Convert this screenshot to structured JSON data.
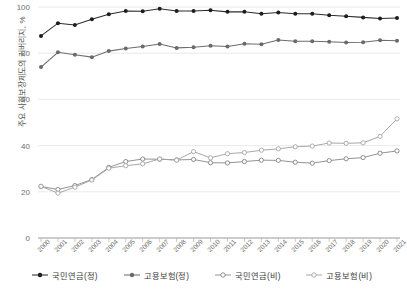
{
  "chart_data": {
    "type": "line",
    "title": "",
    "subtitle": "",
    "xlabel": "",
    "ylabel": "주요 사회보장제도의 커버리지, %",
    "xlim": [
      2000,
      2021
    ],
    "ylim": [
      0,
      100
    ],
    "yticks": [
      0,
      20,
      40,
      60,
      80,
      100
    ],
    "grid": true,
    "legend_position": "bottom",
    "categories": [
      "2000",
      "2001",
      "2002",
      "2003",
      "2004",
      "2005",
      "2006",
      "2007",
      "2008",
      "2009",
      "2010",
      "2011",
      "2012",
      "2013",
      "2014",
      "2015",
      "2016",
      "2017",
      "2018",
      "2019",
      "2020",
      "2021"
    ],
    "series": [
      {
        "name": "국민연금(정)",
        "marker": "filled-circle",
        "color": "#1d1d1d",
        "values": [
          87.5,
          93.0,
          92.2,
          94.7,
          96.9,
          98.3,
          98.2,
          99.2,
          98.3,
          98.3,
          98.6,
          97.9,
          97.9,
          97.1,
          97.6,
          97.1,
          97.1,
          96.4,
          96.0,
          95.5,
          95.0,
          95.2
        ]
      },
      {
        "name": "고용보험(정)",
        "marker": "filled-circle",
        "color": "#6a6a6a",
        "values": [
          74.0,
          80.4,
          79.3,
          78.3,
          80.9,
          82.0,
          82.9,
          84.0,
          82.3,
          82.6,
          83.2,
          82.9,
          84.1,
          83.9,
          85.7,
          85.2,
          85.2,
          85.0,
          84.6,
          84.7,
          85.6,
          85.4
        ]
      },
      {
        "name": "국민연금(비)",
        "marker": "open-circle",
        "color": "#7d7d7d",
        "values": [
          22.3,
          21.0,
          22.7,
          25.3,
          30.6,
          33.1,
          34.2,
          34.1,
          33.8,
          34.0,
          32.6,
          32.5,
          33.1,
          33.7,
          33.6,
          32.8,
          32.4,
          33.5,
          34.3,
          34.8,
          36.7,
          37.7
        ]
      },
      {
        "name": "고용보험(비)",
        "marker": "open-circle",
        "color": "#a0a0a0",
        "values": [
          22.4,
          19.4,
          22.0,
          25.1,
          30.2,
          31.3,
          32.1,
          34.2,
          33.7,
          37.4,
          34.7,
          36.5,
          37.0,
          38.0,
          38.6,
          39.5,
          39.8,
          41.1,
          41.0,
          41.2,
          44.0,
          51.6
        ]
      }
    ]
  },
  "axes": {
    "y_tick_labels": [
      "0",
      "20",
      "40",
      "60",
      "80",
      "100"
    ],
    "x_tick_labels": [
      "2000",
      "2001",
      "2002",
      "2003",
      "2004",
      "2005",
      "2006",
      "2007",
      "2008",
      "2009",
      "2010",
      "2011",
      "2012",
      "2013",
      "2014",
      "2015",
      "2016",
      "2017",
      "2018",
      "2019",
      "2020",
      "2021"
    ]
  },
  "legend": {
    "items": [
      {
        "label": "국민연금(정)"
      },
      {
        "label": "고용보험(정)"
      },
      {
        "label": "국민연금(비)"
      },
      {
        "label": "고용보험(비)"
      }
    ]
  }
}
